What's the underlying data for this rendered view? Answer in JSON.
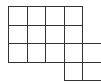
{
  "diagram": {
    "type": "grid-polyomino",
    "cell_size": 18.5,
    "origin": [
      8,
      6
    ],
    "line_color": "#333333",
    "fill_color": "#ffffff",
    "rows": [
      {
        "row": 0,
        "cols": [
          0,
          1,
          2,
          3
        ]
      },
      {
        "row": 1,
        "cols": [
          0,
          1,
          2,
          3
        ]
      },
      {
        "row": 2,
        "cols": [
          0,
          1,
          2,
          3,
          4
        ]
      },
      {
        "row": 3,
        "cols": [
          3,
          4
        ]
      }
    ],
    "total_cells": 15
  }
}
